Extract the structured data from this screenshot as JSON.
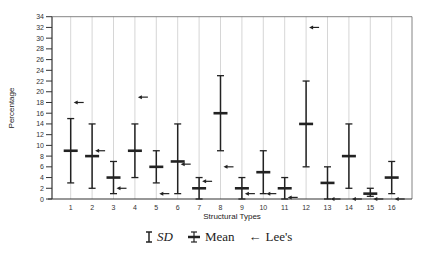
{
  "chart_data": {
    "type": "errorbar",
    "title": "",
    "xlabel": "Structural Types",
    "ylabel": "Percentage",
    "ylim": [
      0,
      34
    ],
    "yticks": [
      0,
      2,
      4,
      6,
      8,
      10,
      12,
      14,
      16,
      18,
      20,
      22,
      24,
      26,
      28,
      30,
      32,
      34
    ],
    "categories": [
      "1",
      "2",
      "3",
      "4",
      "5",
      "6",
      "7",
      "8",
      "9",
      "10",
      "11",
      "12",
      "13",
      "14",
      "15",
      "16"
    ],
    "grid": "vertical at categories",
    "series": [
      {
        "name": "Mean",
        "values": [
          9,
          8,
          4,
          9,
          6,
          7,
          2,
          16,
          2,
          5,
          2,
          14,
          3,
          8,
          1,
          4
        ]
      },
      {
        "name": "SD upper",
        "values": [
          15,
          14,
          7,
          14,
          9,
          14,
          4,
          23,
          4,
          9,
          4,
          22,
          6,
          14,
          2,
          7
        ]
      },
      {
        "name": "SD lower",
        "values": [
          3,
          2,
          1,
          4,
          3,
          1,
          0,
          9,
          0,
          1,
          0,
          6,
          0,
          2,
          0.5,
          1
        ]
      },
      {
        "name": "Lee's",
        "values": [
          18,
          9,
          2,
          19,
          1,
          6.5,
          3.3,
          6,
          1,
          1,
          0.3,
          32,
          0,
          0,
          0,
          0
        ]
      }
    ],
    "legend": {
      "position": "bottom",
      "entries": [
        {
          "symbol": "I",
          "label": "SD"
        },
        {
          "symbol": "mean-bar",
          "label": "Mean"
        },
        {
          "symbol": "←",
          "label": "Lee's"
        }
      ]
    }
  },
  "legend": {
    "sd_label": "SD",
    "mean_label": "Mean",
    "lee_label": "Lee's",
    "arrow_glyph": "←"
  },
  "colors": {
    "bars": "#222222",
    "grid": "#cccccc",
    "axis": "#333333"
  }
}
